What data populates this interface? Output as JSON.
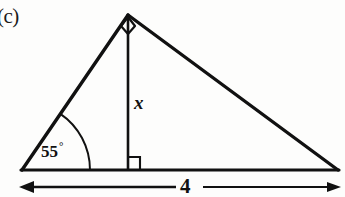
{
  "figure": {
    "part_label": "(c)",
    "background_color": "#fdfdfc",
    "stroke_color": "#111111",
    "shape": "triangle-with-altitude",
    "angle": {
      "value": "55",
      "degree_symbol": "°",
      "vertex": "left-base"
    },
    "altitude": {
      "label": "x",
      "description": "vertical altitude from apex to base",
      "right_angle_marker": true
    },
    "apex": {
      "right_angle_marker": true
    },
    "base": {
      "label": "4",
      "dimension_line": true,
      "arrowheads": "both-ends"
    }
  }
}
